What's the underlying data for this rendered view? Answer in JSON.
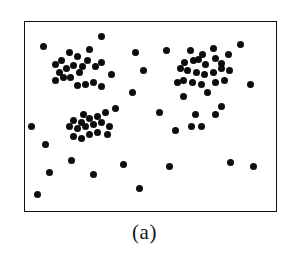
{
  "figure": {
    "caption": "(a)",
    "frame": {
      "x": 24,
      "y": 21,
      "width": 253,
      "height": 191,
      "border_color": "#111111",
      "background_color": "#ffffff"
    },
    "point_style": {
      "color": "#0d0d0d",
      "diameter": 7,
      "shape": "filled-circle"
    }
  },
  "chart_data": {
    "type": "scatter",
    "title": "",
    "subtitle": "",
    "xlabel": "",
    "ylabel": "",
    "annotations": [
      "(a)"
    ],
    "grid": false,
    "legend": "none",
    "axis_ticks": "none",
    "xlim": [
      0,
      253
    ],
    "ylim": [
      0,
      191
    ],
    "y_axis_direction": "down",
    "series": [
      {
        "name": "cluster-top-left",
        "n": 21,
        "points": [
          [
            36,
            38
          ],
          [
            44,
            30
          ],
          [
            52,
            34
          ],
          [
            57,
            44
          ],
          [
            64,
            27
          ],
          [
            30,
            42
          ],
          [
            34,
            50
          ],
          [
            41,
            46
          ],
          [
            48,
            43
          ],
          [
            38,
            55
          ],
          [
            45,
            55
          ],
          [
            54,
            50
          ],
          [
            62,
            38
          ],
          [
            70,
            44
          ],
          [
            76,
            40
          ],
          [
            52,
            63
          ],
          [
            60,
            62
          ],
          [
            68,
            60
          ],
          [
            76,
            64
          ],
          [
            86,
            52
          ],
          [
            30,
            58
          ]
        ]
      },
      {
        "name": "cluster-top-right",
        "n": 22,
        "points": [
          [
            165,
            28
          ],
          [
            177,
            32
          ],
          [
            188,
            26
          ],
          [
            159,
            40
          ],
          [
            168,
            38
          ],
          [
            173,
            37
          ],
          [
            180,
            42
          ],
          [
            190,
            36
          ],
          [
            196,
            41
          ],
          [
            203,
            32
          ],
          [
            155,
            46
          ],
          [
            162,
            48
          ],
          [
            171,
            50
          ],
          [
            179,
            52
          ],
          [
            188,
            50
          ],
          [
            196,
            46
          ],
          [
            204,
            48
          ],
          [
            158,
            58
          ],
          [
            167,
            60
          ],
          [
            176,
            62
          ],
          [
            190,
            60
          ],
          [
            199,
            58
          ]
        ]
      },
      {
        "name": "cluster-bottom-left",
        "n": 18,
        "points": [
          [
            58,
            92
          ],
          [
            48,
            98
          ],
          [
            56,
            100
          ],
          [
            64,
            96
          ],
          [
            72,
            94
          ],
          [
            80,
            90
          ],
          [
            44,
            104
          ],
          [
            52,
            106
          ],
          [
            60,
            104
          ],
          [
            68,
            102
          ],
          [
            76,
            100
          ],
          [
            84,
            104
          ],
          [
            48,
            114
          ],
          [
            56,
            116
          ],
          [
            64,
            112
          ],
          [
            72,
            110
          ],
          [
            82,
            112
          ],
          [
            90,
            86
          ]
        ]
      },
      {
        "name": "cluster-bottom-right",
        "n": 5,
        "points": [
          [
            170,
            92
          ],
          [
            166,
            104
          ],
          [
            176,
            104
          ],
          [
            190,
            92
          ],
          [
            150,
            108
          ]
        ]
      },
      {
        "name": "noise",
        "n": 24,
        "points": [
          [
            18,
            24
          ],
          [
            76,
            14
          ],
          [
            110,
            30
          ],
          [
            141,
            28
          ],
          [
            118,
            48
          ],
          [
            107,
            70
          ],
          [
            134,
            90
          ],
          [
            6,
            104
          ],
          [
            20,
            122
          ],
          [
            46,
            138
          ],
          [
            24,
            150
          ],
          [
            12,
            172
          ],
          [
            68,
            152
          ],
          [
            98,
            142
          ],
          [
            114,
            166
          ],
          [
            152,
            60
          ],
          [
            158,
            74
          ],
          [
            182,
            70
          ],
          [
            196,
            84
          ],
          [
            215,
            22
          ],
          [
            225,
            62
          ],
          [
            205,
            140
          ],
          [
            144,
            144
          ],
          [
            228,
            144
          ]
        ]
      }
    ]
  }
}
